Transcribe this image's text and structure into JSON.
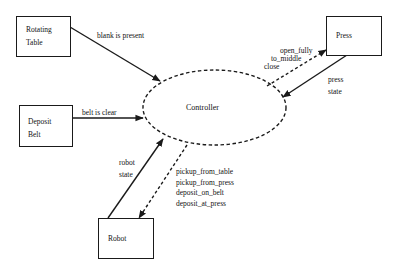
{
  "diagram": {
    "type": "context-diagram",
    "controller": {
      "label": "Controller"
    },
    "entities": [
      {
        "id": "rotating_table",
        "label": "Rotating\nTable"
      },
      {
        "id": "deposit_belt",
        "label": "Deposit\nBelt"
      },
      {
        "id": "press",
        "label": "Press"
      },
      {
        "id": "robot",
        "label": "Robot"
      }
    ],
    "flows": [
      {
        "from": "rotating_table",
        "to": "controller",
        "style": "solid",
        "label": "blank is present"
      },
      {
        "from": "deposit_belt",
        "to": "controller",
        "style": "solid",
        "label": "belt is clear"
      },
      {
        "from": "controller",
        "to": "press",
        "style": "dashed",
        "label": "open_fully\nto_middle\nclose"
      },
      {
        "from": "press",
        "to": "controller",
        "style": "solid",
        "label": "press\nstate"
      },
      {
        "from": "robot",
        "to": "controller",
        "style": "solid",
        "label": "robot\nstate"
      },
      {
        "from": "controller",
        "to": "robot",
        "style": "dashed",
        "label": "pickup_from_table\npickup_from_press\ndeposit_on_belt\ndeposit_at_press"
      }
    ]
  },
  "labels": {
    "controller": "Controller",
    "rotating_table": "Rotating\nTable",
    "deposit_belt": "Deposit\nBelt",
    "press": "Press",
    "robot": "Robot",
    "blank_is_present": "blank is present",
    "belt_is_clear": "belt is clear",
    "press_commands": "open_fully\nto_middle\nclose",
    "press_state": "press\nstate",
    "robot_state": "robot\nstate",
    "robot_commands": "pickup_from_table\npickup_from_press\ndeposit_on_belt\ndeposit_at_press"
  },
  "colors": {
    "line": "#1a1a1a",
    "background": "#ffffff"
  }
}
